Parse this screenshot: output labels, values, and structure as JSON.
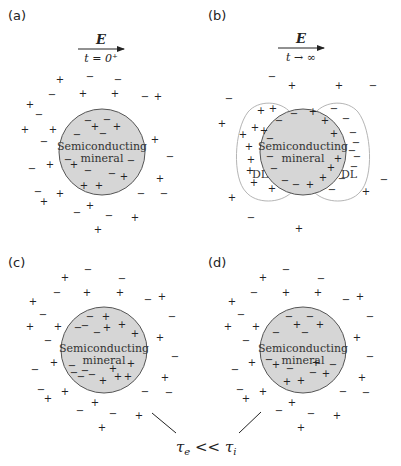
{
  "panels": [
    {
      "id": "a",
      "label": "(a)",
      "label_pos": [
        8,
        20
      ],
      "field": {
        "symbol": "E",
        "time": "t = 0⁺",
        "x1": 78,
        "x2": 124,
        "y": 49,
        "label_x": 101
      },
      "mineral": {
        "cx": 102,
        "cy": 152,
        "r": 43,
        "line1": "Semiconducting",
        "line2": "mineral"
      },
      "charges": [
        [
          "+",
          60,
          83
        ],
        [
          "−",
          90,
          80
        ],
        [
          "−",
          118,
          83
        ],
        [
          "−",
          52,
          98
        ],
        [
          "+",
          83,
          97
        ],
        [
          "+",
          115,
          97
        ],
        [
          "−",
          145,
          100
        ],
        [
          "+",
          158,
          100
        ],
        [
          "+",
          30,
          108
        ],
        [
          "−",
          39,
          118
        ],
        [
          "+",
          25,
          133
        ],
        [
          "+",
          53,
          133
        ],
        [
          "−",
          44,
          145
        ],
        [
          "−",
          88,
          124
        ],
        [
          "−",
          107,
          123
        ],
        [
          "+",
          95,
          130
        ],
        [
          "+",
          117,
          130
        ],
        [
          "−",
          77,
          138
        ],
        [
          "−",
          103,
          137
        ],
        [
          "+",
          155,
          143
        ],
        [
          "−",
          170,
          160
        ],
        [
          "−",
          68,
          163
        ],
        [
          "+",
          74,
          168
        ],
        [
          "−",
          131,
          164
        ],
        [
          "+",
          50,
          168
        ],
        [
          "−",
          32,
          172
        ],
        [
          "−",
          88,
          174
        ],
        [
          "−",
          112,
          177
        ],
        [
          "+",
          124,
          180
        ],
        [
          "+",
          160,
          182
        ],
        [
          "+",
          84,
          189
        ],
        [
          "+",
          99,
          189
        ],
        [
          "−",
          38,
          195
        ],
        [
          "+",
          60,
          197
        ],
        [
          "−",
          141,
          197
        ],
        [
          "−",
          164,
          197
        ],
        [
          "+",
          44,
          205
        ],
        [
          "+",
          90,
          209
        ],
        [
          "−",
          77,
          216
        ],
        [
          "−",
          109,
          219
        ],
        [
          "+",
          135,
          221
        ],
        [
          "+",
          98,
          233
        ]
      ]
    },
    {
      "id": "b",
      "label": "(b)",
      "label_pos": [
        208,
        20
      ],
      "field": {
        "symbol": "E",
        "time": "t → ∞",
        "x1": 278,
        "x2": 324,
        "y": 48,
        "label_x": 301
      },
      "mineral": {
        "cx": 303,
        "cy": 152,
        "r": 43,
        "line1": "Semiconducting",
        "line2": "mineral"
      },
      "dl_left_label": {
        "text": "DL",
        "x": 252,
        "y": 178
      },
      "dl_right_label": {
        "text": "DL",
        "x": 341,
        "y": 178
      },
      "charges": [
        [
          "−",
          272,
          80
        ],
        [
          "+",
          292,
          89
        ],
        [
          "+",
          339,
          89
        ],
        [
          "−",
          373,
          89
        ],
        [
          "−",
          229,
          102
        ],
        [
          "+",
          261,
          114
        ],
        [
          "+",
          273,
          112
        ],
        [
          "−",
          294,
          117
        ],
        [
          "+",
          313,
          115
        ],
        [
          "−",
          334,
          112
        ],
        [
          "+",
          222,
          127
        ],
        [
          "+",
          255,
          131
        ],
        [
          "−",
          279,
          124
        ],
        [
          "+",
          325,
          124
        ],
        [
          "−",
          346,
          122
        ],
        [
          "+",
          243,
          138
        ],
        [
          "+",
          264,
          134
        ],
        [
          "−",
          270,
          142
        ],
        [
          "+",
          334,
          137
        ],
        [
          "−",
          353,
          136
        ],
        [
          "−",
          356,
          146
        ],
        [
          "+",
          249,
          150
        ],
        [
          "−",
          352,
          154
        ],
        [
          "+",
          251,
          163
        ],
        [
          "−",
          270,
          160
        ],
        [
          "−",
          357,
          160
        ],
        [
          "+",
          338,
          162
        ],
        [
          "+",
          250,
          174
        ],
        [
          "−",
          274,
          172
        ],
        [
          "+",
          331,
          171
        ],
        [
          "−",
          354,
          170
        ],
        [
          "−",
          285,
          184
        ],
        [
          "−",
          296,
          188
        ],
        [
          "+",
          310,
          188
        ],
        [
          "+",
          323,
          181
        ],
        [
          "−",
          342,
          182
        ],
        [
          "−",
          384,
          183
        ],
        [
          "+",
          254,
          186
        ],
        [
          "+",
          272,
          192
        ],
        [
          "−",
          332,
          193
        ],
        [
          "+",
          366,
          195
        ],
        [
          "+",
          232,
          201
        ],
        [
          "−",
          251,
          221
        ],
        [
          "+",
          299,
          232
        ]
      ]
    },
    {
      "id": "c",
      "label": "(c)",
      "label_pos": [
        8,
        267
      ],
      "mineral": {
        "cx": 104,
        "cy": 350,
        "r": 43,
        "line1": "Semiconducting",
        "line2": "mineral"
      },
      "charges": [
        [
          "−",
          88,
          273
        ],
        [
          "+",
          65,
          281
        ],
        [
          "−",
          122,
          282
        ],
        [
          "−",
          57,
          296
        ],
        [
          "+",
          87,
          296
        ],
        [
          "+",
          120,
          296
        ],
        [
          "−",
          148,
          303
        ],
        [
          "+",
          162,
          300
        ],
        [
          "+",
          33,
          305
        ],
        [
          "−",
          43,
          318
        ],
        [
          "−",
          90,
          320
        ],
        [
          "+",
          106,
          320
        ],
        [
          "−",
          172,
          320
        ],
        [
          "+",
          30,
          330
        ],
        [
          "+",
          58,
          330
        ],
        [
          "−",
          78,
          331
        ],
        [
          "−",
          85,
          329
        ],
        [
          "−",
          97,
          336
        ],
        [
          "+",
          107,
          331
        ],
        [
          "+",
          122,
          328
        ],
        [
          "+",
          135,
          337
        ],
        [
          "+",
          160,
          341
        ],
        [
          "−",
          48,
          344
        ],
        [
          "−",
          175,
          360
        ],
        [
          "+",
          54,
          366
        ],
        [
          "−",
          72,
          369
        ],
        [
          "−",
          74,
          376
        ],
        [
          "−",
          85,
          374
        ],
        [
          "−",
          92,
          378
        ],
        [
          "+",
          113,
          372
        ],
        [
          "+",
          131,
          367
        ],
        [
          "−",
          35,
          373
        ],
        [
          "+",
          165,
          381
        ],
        [
          "−",
          81,
          380
        ],
        [
          "+",
          103,
          384
        ],
        [
          "+",
          118,
          380
        ],
        [
          "+",
          128,
          380
        ],
        [
          "−",
          41,
          393
        ],
        [
          "+",
          65,
          395
        ],
        [
          "−",
          145,
          395
        ],
        [
          "−",
          169,
          396
        ],
        [
          "+",
          48,
          402
        ],
        [
          "+",
          95,
          406
        ],
        [
          "−",
          80,
          414
        ],
        [
          "−",
          113,
          417
        ],
        [
          "+",
          139,
          419
        ],
        [
          "+",
          102,
          431
        ]
      ]
    },
    {
      "id": "d",
      "label": "(d)",
      "label_pos": [
        208,
        267
      ],
      "mineral": {
        "cx": 303,
        "cy": 350,
        "r": 43,
        "line1": "Semiconducting",
        "line2": "mineral"
      },
      "charges": [
        [
          "−",
          286,
          273
        ],
        [
          "+",
          263,
          281
        ],
        [
          "−",
          321,
          282
        ],
        [
          "−",
          254,
          296
        ],
        [
          "+",
          286,
          296
        ],
        [
          "+",
          318,
          296
        ],
        [
          "−",
          346,
          303
        ],
        [
          "+",
          360,
          300
        ],
        [
          "+",
          232,
          305
        ],
        [
          "−",
          241,
          318
        ],
        [
          "−",
          289,
          320
        ],
        [
          "−",
          310,
          320
        ],
        [
          "−",
          370,
          320
        ],
        [
          "+",
          228,
          330
        ],
        [
          "+",
          256,
          330
        ],
        [
          "+",
          297,
          328
        ],
        [
          "+",
          320,
          328
        ],
        [
          "−",
          276,
          336
        ],
        [
          "−",
          305,
          336
        ],
        [
          "+",
          357,
          341
        ],
        [
          "−",
          246,
          344
        ],
        [
          "−",
          370,
          360
        ],
        [
          "+",
          252,
          366
        ],
        [
          "−",
          269,
          363
        ],
        [
          "+",
          276,
          368
        ],
        [
          "+",
          316,
          366
        ],
        [
          "−",
          333,
          368
        ],
        [
          "−",
          235,
          373
        ],
        [
          "−",
          290,
          372
        ],
        [
          "−",
          313,
          376
        ],
        [
          "+",
          326,
          377
        ],
        [
          "+",
          362,
          381
        ],
        [
          "+",
          287,
          385
        ],
        [
          "+",
          301,
          384
        ],
        [
          "−",
          240,
          393
        ],
        [
          "+",
          263,
          395
        ],
        [
          "−",
          343,
          395
        ],
        [
          "−",
          366,
          396
        ],
        [
          "+",
          246,
          402
        ],
        [
          "+",
          292,
          406
        ],
        [
          "−",
          279,
          414
        ],
        [
          "−",
          311,
          417
        ],
        [
          "+",
          337,
          419
        ],
        [
          "+",
          301,
          431
        ]
      ]
    }
  ],
  "connector": {
    "left_line": [
      152,
      413,
      176,
      433
    ],
    "right_line": [
      261,
      412,
      239,
      433
    ],
    "relation": "τe << τi",
    "tau_e": "τ",
    "tau_e_sub": "e",
    "op": " << ",
    "tau_i": "τ",
    "tau_i_sub": "i",
    "x": 176,
    "y": 452
  },
  "colors": {
    "mineral_fill": "#d6d6d6",
    "mineral_stroke": "#555555",
    "dl_stroke": "#b5b5b5",
    "text": "#222222"
  }
}
